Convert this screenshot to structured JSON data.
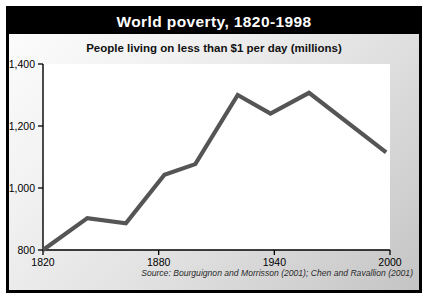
{
  "chart_data": {
    "type": "line",
    "title": "World poverty, 1820-1998",
    "subtitle": "People living on less than $1 per day (millions)",
    "xlabel": "",
    "ylabel": "",
    "xlim": [
      1820,
      2000
    ],
    "ylim": [
      800,
      1400
    ],
    "xticks": [
      "1820",
      "1880",
      "1940",
      "2000"
    ],
    "xtick_values": [
      1820,
      1880,
      1940,
      2000
    ],
    "yticks": [
      "800",
      "1,000",
      "1,200",
      "1,400"
    ],
    "ytick_values": [
      800,
      1000,
      1200,
      1400
    ],
    "grid": false,
    "legend": false,
    "series": [
      {
        "name": "People living on less than $1 per day (millions)",
        "color": "#555555",
        "x": [
          1820,
          1843,
          1863,
          1883,
          1899,
          1921,
          1938,
          1958,
          1998
        ],
        "values": [
          800,
          903,
          886,
          1043,
          1077,
          1300,
          1240,
          1307,
          1115
        ]
      }
    ],
    "source": "Source: Bourguignon and Morrisson (2001); Chen and Ravallion (2001)"
  },
  "header": {
    "title": "World poverty, 1820-1998",
    "title_background": "#000000",
    "title_color": "#ffffff"
  },
  "chart": {
    "subtitle": "People living on less than $1 per day (millions)",
    "source": "Source: Bourguignon and Morrisson (2001); Chen and Ravallion (2001)",
    "line_color": "#555555",
    "axis_color": "#000000",
    "plot_background": "#ffffff"
  }
}
